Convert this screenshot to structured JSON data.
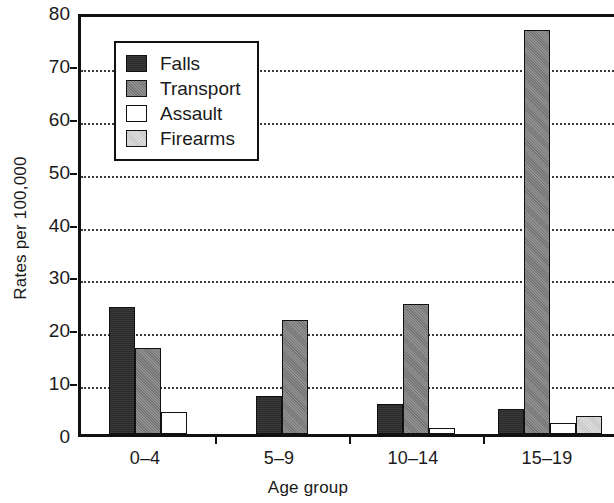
{
  "chart_data": {
    "type": "bar",
    "title": "",
    "xlabel": "Age group",
    "ylabel": "Rates per 100,000",
    "categories": [
      "0–4",
      "5–9",
      "10–14",
      "15–19"
    ],
    "ylim": [
      0,
      80
    ],
    "yticks": [
      0,
      10,
      20,
      30,
      40,
      50,
      60,
      70,
      80
    ],
    "grid": "horizontal-dotted",
    "legend_position": "upper-left-inside",
    "series": [
      {
        "name": "Falls",
        "color": "#2e2e2e",
        "values": [
          24.0,
          7.2,
          5.7,
          4.7
        ]
      },
      {
        "name": "Transport",
        "color": "#828282",
        "values": [
          16.3,
          21.5,
          24.5,
          76.5
        ]
      },
      {
        "name": "Assault",
        "color": "#ffffff",
        "values": [
          4.2,
          0.0,
          1.2,
          2.0
        ]
      },
      {
        "name": "Firearms",
        "color": "#d2d2d2",
        "values": [
          0.0,
          0.0,
          0.0,
          3.5
        ]
      }
    ]
  },
  "legend": {
    "items": [
      {
        "label": "Falls"
      },
      {
        "label": "Transport"
      },
      {
        "label": "Assault"
      },
      {
        "label": "Firearms"
      }
    ]
  },
  "axes": {
    "y_title": "Rates per 100,000",
    "x_title": "Age group",
    "y_tick_labels": [
      "0",
      "10",
      "20",
      "30",
      "40",
      "50",
      "60",
      "70",
      "80"
    ],
    "x_tick_labels": [
      "0–4",
      "5–9",
      "10–14",
      "15–19"
    ]
  },
  "colors": {
    "axis": "#111111",
    "grid": "#3a3a3a",
    "background": "#ffffff"
  }
}
